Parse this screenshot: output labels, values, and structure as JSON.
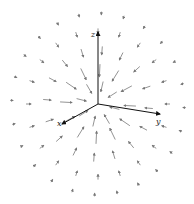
{
  "figure": {
    "axes": {
      "origin": [
        98,
        104
      ],
      "x": {
        "label": "x",
        "end": [
          62,
          124
        ],
        "label_pos": [
          57,
          126
        ]
      },
      "y": {
        "label": "y",
        "end": [
          160,
          114
        ],
        "label_pos": [
          156,
          124
        ]
      },
      "z": {
        "label": "z",
        "end": [
          98,
          32
        ],
        "label_pos": [
          91,
          37
        ]
      }
    },
    "colors": {
      "axis": "#111111",
      "arrow": "#777777"
    },
    "field": {
      "type": "radial-inward",
      "center": [
        98,
        104
      ],
      "rings": [
        {
          "radius": 22,
          "count": 8,
          "length": 10,
          "offset": 0.3
        },
        {
          "radius": 38,
          "count": 12,
          "length": 12,
          "offset": 0.1
        },
        {
          "radius": 55,
          "count": 16,
          "length": 8,
          "offset": 0.2
        },
        {
          "radius": 72,
          "count": 20,
          "length": 5,
          "offset": 0.0
        },
        {
          "radius": 88,
          "count": 24,
          "length": 3,
          "offset": 0.15
        }
      ]
    }
  }
}
